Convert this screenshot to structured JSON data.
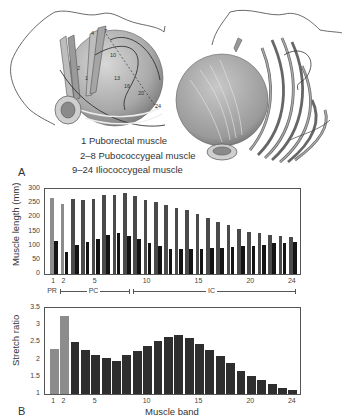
{
  "panel_a": {
    "label": "A",
    "legend": [
      "1   Puborectal muscle",
      "2–8 Pubococcygeal muscle",
      "9–24 Iliococcygeal muscle"
    ],
    "band_markers": [
      "1",
      "2",
      "4",
      "7",
      "10",
      "13",
      "16",
      "20",
      "24"
    ]
  },
  "panel_b": {
    "label": "B"
  },
  "chart_data": [
    {
      "type": "bar",
      "title": "",
      "xlabel": "",
      "ylabel": "Muscle length (mm)",
      "ylim": [
        0,
        300
      ],
      "yticks": [
        0,
        50,
        100,
        150,
        200,
        250,
        300
      ],
      "xticks": [
        "1",
        "2",
        "5",
        "10",
        "15",
        "20",
        "24"
      ],
      "categories": [
        1,
        2,
        3,
        4,
        5,
        6,
        7,
        8,
        9,
        10,
        11,
        12,
        13,
        14,
        15,
        16,
        17,
        18,
        19,
        20,
        21,
        22,
        23,
        24
      ],
      "series": [
        {
          "name": "Stretched length",
          "color": "#4a4a4a",
          "values": [
            270,
            248,
            266,
            262,
            266,
            278,
            278,
            287,
            275,
            262,
            253,
            243,
            232,
            225,
            213,
            198,
            185,
            172,
            160,
            150,
            143,
            137,
            135,
            130
          ]
        },
        {
          "name": "Resting length",
          "color": "#141414",
          "values": [
            118,
            77,
            104,
            114,
            125,
            137,
            143,
            135,
            123,
            110,
            100,
            90,
            88,
            88,
            88,
            92,
            92,
            95,
            98,
            98,
            102,
            108,
            110,
            112
          ]
        }
      ],
      "highlight_colors": [
        "#8c8c8c",
        "#8c8c8c"
      ],
      "groups": [
        {
          "label": "PR",
          "from": 1,
          "to": 1
        },
        {
          "label": "PC",
          "from": 2,
          "to": 8
        },
        {
          "label": "IC",
          "from": 9,
          "to": 24
        }
      ],
      "grid": false
    },
    {
      "type": "bar",
      "title": "",
      "xlabel": "Muscle band",
      "ylabel": "Stretch ratio",
      "ylim": [
        1,
        3.5
      ],
      "yticks": [
        "1",
        "1.5",
        "2",
        "2.5",
        "3",
        "3.5"
      ],
      "xticks": [
        "1",
        "2",
        "5",
        "10",
        "15",
        "20",
        "24"
      ],
      "categories": [
        1,
        2,
        3,
        4,
        5,
        6,
        7,
        8,
        9,
        10,
        11,
        12,
        13,
        14,
        15,
        16,
        17,
        18,
        19,
        20,
        21,
        22,
        23,
        24
      ],
      "values": [
        2.3,
        3.28,
        2.5,
        2.28,
        2.12,
        2.05,
        1.97,
        2.13,
        2.25,
        2.4,
        2.55,
        2.67,
        2.72,
        2.62,
        2.45,
        2.28,
        2.1,
        1.9,
        1.68,
        1.53,
        1.4,
        1.3,
        1.18,
        1.12
      ],
      "grid": false
    }
  ]
}
